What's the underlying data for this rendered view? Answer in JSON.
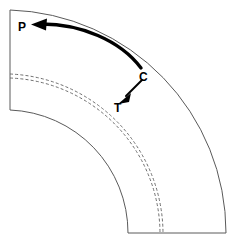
{
  "figure": {
    "width": 233,
    "height": 243,
    "background_color": "#ffffff"
  },
  "labels": {
    "p": "P",
    "c": "C",
    "t": "T"
  },
  "colors": {
    "outline": "#5a5a5a",
    "dashed": "#6e6e6e",
    "arrow": "#000000",
    "background": "#ffffff"
  },
  "geometry": {
    "arc_center": {
      "x": 10,
      "y": 233
    },
    "outer_radius": 223,
    "inner_radius": 123,
    "outer_arc_start": {
      "x": 10,
      "y": 10
    },
    "outer_arc_end": {
      "x": 226,
      "y": 233
    },
    "inner_arc_start": {
      "x": 10,
      "y": 110
    },
    "inner_arc_end": {
      "x": 128,
      "y": 233
    },
    "left_edge": {
      "x": 10,
      "y_top": 10,
      "y_bottom": 110
    },
    "bottom_edge": {
      "y": 233,
      "x_left": 128,
      "x_right": 226
    },
    "dashed_arc_outer_radius": 160,
    "dashed_arc_inner_radius": 156,
    "dashed_arc_start_left": {
      "x": 10,
      "y": 74
    },
    "dashed_arc_end_bottom": {
      "x": 163,
      "y": 233
    }
  },
  "annotations": {
    "curved_arrow": {
      "name": "arrow-C-to-P",
      "from": "C",
      "to": "P",
      "start": {
        "x": 141,
        "y": 67
      },
      "end": {
        "x": 36,
        "y": 25
      },
      "style": "thick-curved"
    },
    "straight_arrow": {
      "name": "arrow-C-to-T",
      "from": "C",
      "to": "T",
      "start": {
        "x": 141,
        "y": 81
      },
      "end": {
        "x": 119,
        "y": 101
      },
      "style": "thin-straight"
    }
  }
}
